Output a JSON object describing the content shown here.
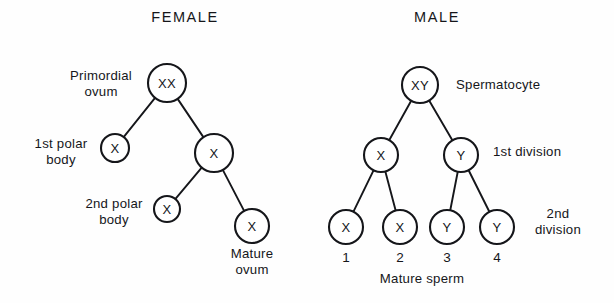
{
  "figure": {
    "title_female": "FEMALE",
    "title_male": "MALE",
    "background_color": "#fefefe",
    "ink_color": "#15161a"
  },
  "chart_data": {
    "type": "diagram",
    "title": "",
    "subtype": "meiosis-lineage-tree",
    "panels": [
      {
        "name": "female",
        "heading": "FEMALE",
        "heading_pos": {
          "x": 185,
          "y": 22
        },
        "nodes": [
          {
            "id": "f-ovum",
            "label": "XX",
            "cx": 167,
            "cy": 83,
            "r": 19,
            "font": 13
          },
          {
            "id": "f-polar1",
            "label": "X",
            "cx": 115,
            "cy": 148,
            "r": 14,
            "font": 12
          },
          {
            "id": "f-secondary",
            "label": "X",
            "cx": 214,
            "cy": 153,
            "r": 19,
            "font": 13
          },
          {
            "id": "f-polar2",
            "label": "X",
            "cx": 167,
            "cy": 209,
            "r": 13,
            "font": 12
          },
          {
            "id": "f-mature-ovum",
            "label": "X",
            "cx": 252,
            "cy": 226,
            "r": 17,
            "font": 13
          }
        ],
        "edges": [
          {
            "from": "f-ovum",
            "to": "f-polar1"
          },
          {
            "from": "f-ovum",
            "to": "f-secondary"
          },
          {
            "from": "f-secondary",
            "to": "f-polar2"
          },
          {
            "from": "f-secondary",
            "to": "f-mature-ovum"
          }
        ],
        "labels": [
          {
            "id": "primordial-ovum",
            "lines": [
              "Primordial",
              "ovum"
            ],
            "x": 101,
            "y": 80,
            "align": "center"
          },
          {
            "id": "first-polar-body",
            "lines": [
              "1st polar",
              "body"
            ],
            "x": 61,
            "y": 148,
            "align": "center"
          },
          {
            "id": "second-polar-body",
            "lines": [
              "2nd polar",
              "body"
            ],
            "x": 114,
            "y": 208,
            "align": "center"
          },
          {
            "id": "mature-ovum",
            "lines": [
              "Mature",
              "ovum"
            ],
            "x": 252,
            "y": 258,
            "align": "center"
          }
        ]
      },
      {
        "name": "male",
        "heading": "MALE",
        "heading_pos": {
          "x": 437,
          "y": 22
        },
        "nodes": [
          {
            "id": "m-spermatocyte",
            "label": "XY",
            "cx": 420,
            "cy": 85,
            "r": 18,
            "font": 13
          },
          {
            "id": "m-div1-x",
            "label": "X",
            "cx": 381,
            "cy": 155,
            "r": 17,
            "font": 13
          },
          {
            "id": "m-div1-y",
            "label": "Y",
            "cx": 461,
            "cy": 155,
            "r": 17,
            "font": 13
          },
          {
            "id": "m-sperm-1",
            "label": "X",
            "cx": 346,
            "cy": 227,
            "r": 17,
            "font": 13
          },
          {
            "id": "m-sperm-2",
            "label": "X",
            "cx": 400,
            "cy": 227,
            "r": 17,
            "font": 13
          },
          {
            "id": "m-sperm-3",
            "label": "Y",
            "cx": 447,
            "cy": 227,
            "r": 17,
            "font": 13
          },
          {
            "id": "m-sperm-4",
            "label": "Y",
            "cx": 497,
            "cy": 227,
            "r": 17,
            "font": 13
          }
        ],
        "edges": [
          {
            "from": "m-spermatocyte",
            "to": "m-div1-x"
          },
          {
            "from": "m-spermatocyte",
            "to": "m-div1-y"
          },
          {
            "from": "m-div1-x",
            "to": "m-sperm-1"
          },
          {
            "from": "m-div1-x",
            "to": "m-sperm-2"
          },
          {
            "from": "m-div1-y",
            "to": "m-sperm-3"
          },
          {
            "from": "m-div1-y",
            "to": "m-sperm-4"
          }
        ],
        "labels": [
          {
            "id": "spermatocyte",
            "lines": [
              "Spermatocyte"
            ],
            "x": 456,
            "y": 89,
            "align": "start"
          },
          {
            "id": "first-division",
            "lines": [
              "1st division"
            ],
            "x": 493,
            "y": 156,
            "align": "start"
          },
          {
            "id": "second-division",
            "lines": [
              "2nd",
              "division"
            ],
            "x": 558,
            "y": 218,
            "align": "center"
          },
          {
            "id": "mature-sperm",
            "lines": [
              "Mature sperm"
            ],
            "x": 422,
            "y": 283,
            "align": "center"
          }
        ],
        "sperm_numbers": [
          {
            "id": "sperm-number-1",
            "text": "1",
            "x": 346,
            "y": 262
          },
          {
            "id": "sperm-number-2",
            "text": "2",
            "x": 400,
            "y": 262
          },
          {
            "id": "sperm-number-3",
            "text": "3",
            "x": 447,
            "y": 262
          },
          {
            "id": "sperm-number-4",
            "text": "4",
            "x": 497,
            "y": 262
          }
        ]
      }
    ]
  }
}
